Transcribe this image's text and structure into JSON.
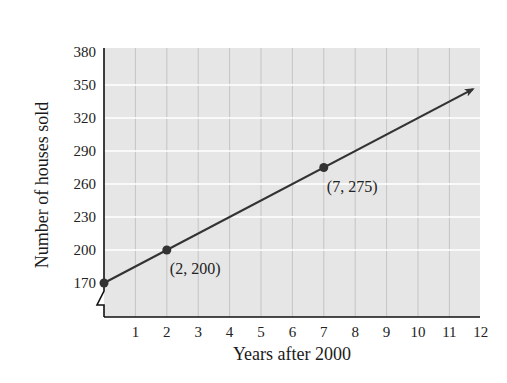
{
  "chart_data": {
    "type": "line",
    "title": "",
    "xlabel": "Years after 2000",
    "ylabel": "Number of houses sold",
    "xlim": [
      0,
      12
    ],
    "ylim": [
      170,
      380
    ],
    "x_ticks": [
      1,
      2,
      3,
      4,
      5,
      6,
      7,
      8,
      9,
      10,
      11,
      12
    ],
    "y_ticks": [
      170,
      200,
      230,
      260,
      290,
      320,
      350,
      380
    ],
    "grid": true,
    "axis_break_y": true,
    "series": [
      {
        "name": "Houses sold",
        "x": [
          0,
          2,
          7,
          12
        ],
        "y": [
          170,
          200,
          275,
          350
        ],
        "marked_points": [
          {
            "x": 0,
            "y": 170,
            "label": ""
          },
          {
            "x": 2,
            "y": 200,
            "label": "(2, 200)"
          },
          {
            "x": 7,
            "y": 275,
            "label": "(7, 275)"
          }
        ],
        "arrow_end": true,
        "color": "#333333"
      }
    ],
    "annotations": [
      "(2, 200)",
      "(7, 275)"
    ]
  },
  "style": {
    "plot_bg": "#e6e6e6",
    "h_grid_color": "#ffffff",
    "v_grid_color": "#c4c4c4",
    "line_color": "#333333",
    "axis_color": "#111111"
  }
}
